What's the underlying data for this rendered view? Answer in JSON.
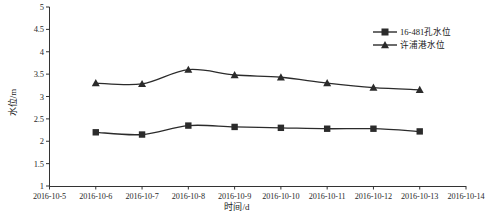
{
  "chart_data": {
    "type": "line",
    "title": "",
    "xlabel": "时间/d",
    "ylabel": "水位/m",
    "ylim": [
      1,
      5
    ],
    "ytick_step": 0.5,
    "yticks": [
      "1",
      "1.5",
      "2",
      "2.5",
      "3",
      "3.5",
      "4",
      "4.5",
      "5"
    ],
    "grid": false,
    "legend_position": "top-right",
    "categories": [
      "2016-10-5",
      "2016-10-6",
      "2016-10-7",
      "2016-10-8",
      "2016-10-9",
      "2016-10-10",
      "2016-10-11",
      "2016-10-12",
      "2016-10-13",
      "2016-10-14"
    ],
    "series": [
      {
        "name": "16-481孔水位",
        "marker": "square",
        "color": "#2b2b2b",
        "x": [
          "2016-10-6",
          "2016-10-7",
          "2016-10-8",
          "2016-10-9",
          "2016-10-10",
          "2016-10-11",
          "2016-10-12",
          "2016-10-13"
        ],
        "values": [
          2.2,
          2.15,
          2.35,
          2.32,
          2.3,
          2.28,
          2.28,
          2.22
        ]
      },
      {
        "name": "许浦港水位",
        "marker": "triangle",
        "color": "#2b2b2b",
        "x": [
          "2016-10-6",
          "2016-10-7",
          "2016-10-8",
          "2016-10-9",
          "2016-10-10",
          "2016-10-11",
          "2016-10-12",
          "2016-10-13"
        ],
        "values": [
          3.3,
          3.28,
          3.6,
          3.48,
          3.43,
          3.3,
          3.2,
          3.15
        ]
      }
    ]
  },
  "legend": {
    "items": [
      {
        "label": "16-481孔水位"
      },
      {
        "label": "许浦港水位"
      }
    ]
  }
}
